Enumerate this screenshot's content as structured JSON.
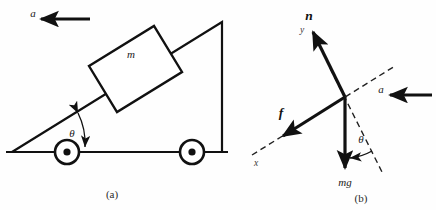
{
  "figure": {
    "background_color": "#fefefe",
    "ink_color": "#111111",
    "width": 436,
    "height": 210
  },
  "panel_a": {
    "caption": "(a)",
    "acceleration_label": "a",
    "block_mass_label": "m",
    "incline_angle_label": "θ",
    "description_parts": {
      "wedge": "right-triangle wedge on wheels",
      "block": "rectangular block resting on incline",
      "wheels": "two wheels with hub dots",
      "ground": "horizontal ground line"
    }
  },
  "panel_b": {
    "caption": "(b)",
    "normal_force_label": "n",
    "normal_axis_label": "y",
    "friction_force_label": "f",
    "friction_axis_label": "x",
    "weight_label": "mg",
    "acceleration_label": "a",
    "angle_label": "θ",
    "description_parts": {
      "axes": "tilted dashed x-y axis pair",
      "vectors": "free-body diagram force vectors"
    }
  }
}
